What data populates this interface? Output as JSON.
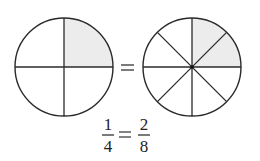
{
  "diagram": {
    "left_circle": {
      "parts": 4,
      "shaded": 1,
      "label": "1/4"
    },
    "right_circle": {
      "parts": 8,
      "shaded": 2,
      "label": "2/8"
    },
    "equals_sign": "=",
    "equation": {
      "left": {
        "numerator": "1",
        "denominator": "4"
      },
      "operator": "=",
      "right": {
        "numerator": "2",
        "denominator": "8"
      }
    },
    "colors": {
      "stroke": "#2a2a2a",
      "shade": "#ececec",
      "background": "#ffffff"
    }
  }
}
